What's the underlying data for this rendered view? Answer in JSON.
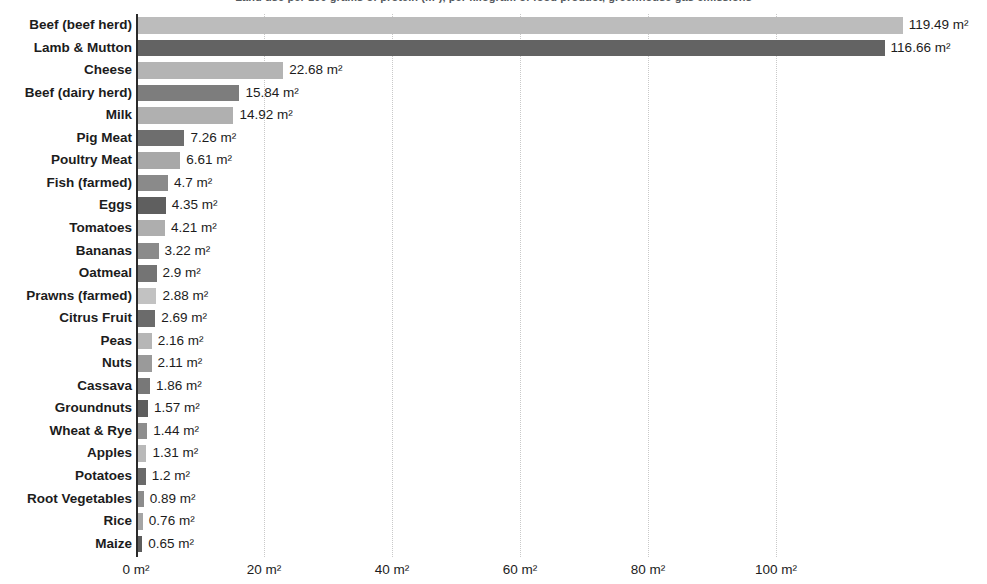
{
  "chart_data": {
    "type": "bar",
    "orientation": "horizontal",
    "title": "Land use per 100 grams of protein (m²), per kilogram of food product, greenhouse gas emissions",
    "xlabel": "",
    "ylabel": "",
    "unit": "m²",
    "xlim": [
      0,
      119.49
    ],
    "axis_max_px_value": 124,
    "grid": true,
    "grid_axis": "x",
    "legend": "none",
    "xticks": [
      0,
      20,
      40,
      60,
      80,
      100
    ],
    "xtick_labels": [
      "0 m²",
      "20 m²",
      "40 m²",
      "60 m²",
      "80 m²",
      "100 m²"
    ],
    "categories": [
      "Beef (beef herd)",
      "Lamb & Mutton",
      "Cheese",
      "Beef (dairy herd)",
      "Milk",
      "Pig Meat",
      "Poultry Meat",
      "Fish (farmed)",
      "Eggs",
      "Tomatoes",
      "Bananas",
      "Oatmeal",
      "Prawns (farmed)",
      "Citrus Fruit",
      "Peas",
      "Nuts",
      "Cassava",
      "Groundnuts",
      "Wheat & Rye",
      "Apples",
      "Potatoes",
      "Root Vegetables",
      "Rice",
      "Maize"
    ],
    "values": [
      119.49,
      116.66,
      22.68,
      15.84,
      14.92,
      7.26,
      6.61,
      4.7,
      4.35,
      4.21,
      3.22,
      2.9,
      2.88,
      2.69,
      2.16,
      2.11,
      1.86,
      1.57,
      1.44,
      1.31,
      1.2,
      0.89,
      0.76,
      0.65
    ],
    "value_labels": [
      "119.49 m²",
      "116.66 m²",
      "22.68 m²",
      "15.84 m²",
      "14.92 m²",
      "7.26 m²",
      "6.61 m²",
      "4.7 m²",
      "4.35 m²",
      "4.21 m²",
      "3.22 m²",
      "2.9 m²",
      "2.88 m²",
      "2.69 m²",
      "2.16 m²",
      "2.11 m²",
      "1.86 m²",
      "1.57 m²",
      "1.44 m²",
      "1.31 m²",
      "1.2 m²",
      "0.89 m²",
      "0.76 m²",
      "0.65 m²"
    ],
    "bar_colors": [
      "#bcbcbc",
      "#636363",
      "#b4b4b4",
      "#7d7d7d",
      "#b0b0b0",
      "#6e6e6e",
      "#a8a8a8",
      "#8a8a8a",
      "#5f5f5f",
      "#aeaeae",
      "#8b8b8b",
      "#747474",
      "#c2c2c2",
      "#6b6b6b",
      "#b6b6b6",
      "#9a9a9a",
      "#787878",
      "#5e5e5e",
      "#8e8e8e",
      "#b9b9b9",
      "#6a6a6a",
      "#8c8c8c",
      "#a5a5a5",
      "#5c5c5c"
    ],
    "colors": {
      "background": "#ffffff",
      "axis": "#2a2a2a",
      "grid": "#c9c9c9",
      "text": "#1c1c1c",
      "title": "#555a5e"
    }
  }
}
